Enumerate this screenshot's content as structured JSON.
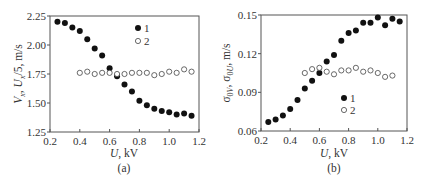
{
  "chart_data": [
    {
      "type": "scatter",
      "panel_label": "(a)",
      "title": "",
      "xlabel": "U, kV",
      "ylabel": "V_x, U_x/5, m/s",
      "xlim": [
        0.2,
        1.2
      ],
      "ylim": [
        1.25,
        2.25
      ],
      "xticks": [
        0.2,
        0.4,
        0.6,
        0.8,
        1.0,
        1.2
      ],
      "xtick_labels": [
        "0.2",
        "0.4",
        "0.6",
        "0.8",
        "1.0",
        "1.2"
      ],
      "yticks": [
        1.25,
        1.5,
        1.75,
        2.0,
        2.25
      ],
      "ytick_labels": [
        "1.25",
        "1.50",
        "1.75",
        "2.00",
        "2.25"
      ],
      "grid": false,
      "legend": {
        "position": "upper right",
        "entries": [
          "1",
          "2"
        ]
      },
      "series": [
        {
          "name": "1",
          "marker": "filled-circle",
          "x": [
            0.25,
            0.3,
            0.35,
            0.4,
            0.45,
            0.5,
            0.55,
            0.6,
            0.65,
            0.7,
            0.75,
            0.8,
            0.85,
            0.9,
            0.95,
            1.0,
            1.05,
            1.1,
            1.15
          ],
          "y": [
            2.2,
            2.19,
            2.15,
            2.12,
            2.05,
            1.97,
            1.91,
            1.8,
            1.73,
            1.66,
            1.6,
            1.52,
            1.48,
            1.45,
            1.43,
            1.42,
            1.4,
            1.41,
            1.39
          ]
        },
        {
          "name": "2",
          "marker": "open-circle",
          "x": [
            0.4,
            0.45,
            0.5,
            0.55,
            0.6,
            0.65,
            0.7,
            0.75,
            0.8,
            0.85,
            0.9,
            0.95,
            1.0,
            1.05,
            1.1,
            1.15
          ],
          "y": [
            1.76,
            1.77,
            1.75,
            1.76,
            1.76,
            1.75,
            1.75,
            1.76,
            1.76,
            1.76,
            1.74,
            1.75,
            1.77,
            1.76,
            1.79,
            1.77
          ]
        }
      ]
    },
    {
      "type": "scatter",
      "panel_label": "(b)",
      "title": "",
      "xlabel": "U, kV",
      "ylabel": "σ_0V, σ_0U, m/s",
      "xlim": [
        0.2,
        1.2
      ],
      "ylim": [
        0.06,
        0.15
      ],
      "xticks": [
        0.2,
        0.4,
        0.6,
        0.8,
        1.0,
        1.2
      ],
      "xtick_labels": [
        "0.2",
        "0.4",
        "0.6",
        "0.8",
        "1.0",
        "1.2"
      ],
      "yticks": [
        0.06,
        0.09,
        0.12,
        0.15
      ],
      "ytick_labels": [
        "0.06",
        "0.09",
        "0.12",
        "0.15"
      ],
      "grid": false,
      "legend": {
        "position": "lower center",
        "entries": [
          "1",
          "2"
        ]
      },
      "series": [
        {
          "name": "1",
          "marker": "filled-circle",
          "x": [
            0.25,
            0.3,
            0.35,
            0.4,
            0.45,
            0.5,
            0.55,
            0.6,
            0.65,
            0.7,
            0.75,
            0.8,
            0.85,
            0.9,
            0.95,
            1.0,
            1.05,
            1.1,
            1.15
          ],
          "y": [
            0.067,
            0.069,
            0.072,
            0.077,
            0.084,
            0.093,
            0.099,
            0.105,
            0.114,
            0.119,
            0.13,
            0.136,
            0.138,
            0.144,
            0.144,
            0.148,
            0.142,
            0.147,
            0.145
          ]
        },
        {
          "name": "2",
          "marker": "open-circle",
          "x": [
            0.5,
            0.55,
            0.6,
            0.65,
            0.7,
            0.75,
            0.8,
            0.85,
            0.9,
            0.95,
            1.0,
            1.05,
            1.1
          ],
          "y": [
            0.105,
            0.108,
            0.109,
            0.106,
            0.104,
            0.107,
            0.107,
            0.109,
            0.106,
            0.107,
            0.105,
            0.102,
            0.103
          ]
        }
      ]
    }
  ],
  "panels": {
    "a": {
      "label": "(a)",
      "xlabel_var": "U",
      "xlabel_unit": ", kV",
      "legend_1": "1",
      "legend_2": "2"
    },
    "b": {
      "label": "(b)",
      "xlabel_var": "U",
      "xlabel_unit": ", kV",
      "legend_1": "1",
      "legend_2": "2"
    }
  }
}
